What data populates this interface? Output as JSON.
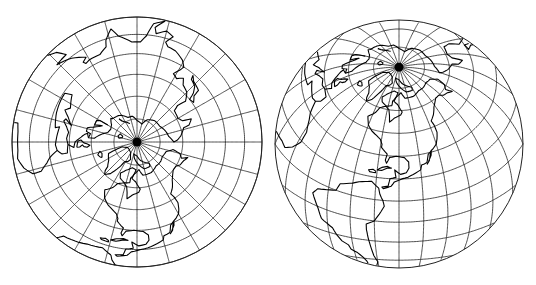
{
  "maps": [
    {
      "name": "polar-azimuthal-map",
      "projection": "lambert-azimuthal-equal-area",
      "center_lat": 90,
      "center_lon": -90,
      "cx": 137,
      "cy": 142,
      "radius": 125,
      "graticule_step_deg": 15,
      "clip_angle_deg": 90
    },
    {
      "name": "oblique-azimuthal-globe",
      "projection": "lambert-azimuthal-equal-area",
      "center_lat": 38,
      "center_lon": -90,
      "cx": 399,
      "cy": 144,
      "radius": 124,
      "graticule_step_deg": 15,
      "clip_angle_deg": 90
    }
  ],
  "colors": {
    "line": "#222222",
    "coast": "#000000",
    "background": "#ffffff"
  },
  "coastlines": [
    {
      "name": "north-america",
      "coords": [
        [
          -168,
          66
        ],
        [
          -162,
          70
        ],
        [
          -150,
          71
        ],
        [
          -140,
          70
        ],
        [
          -128,
          70
        ],
        [
          -115,
          68
        ],
        [
          -100,
          68
        ],
        [
          -94,
          72
        ],
        [
          -85,
          69
        ],
        [
          -82,
          66
        ],
        [
          -88,
          64
        ],
        [
          -94,
          59
        ],
        [
          -92,
          57
        ],
        [
          -85,
          55
        ],
        [
          -80,
          52
        ],
        [
          -79,
          56
        ],
        [
          -77,
          60
        ],
        [
          -72,
          62
        ],
        [
          -65,
          60
        ],
        [
          -62,
          56
        ],
        [
          -56,
          52
        ],
        [
          -60,
          47
        ],
        [
          -65,
          44
        ],
        [
          -70,
          42
        ],
        [
          -74,
          40
        ],
        [
          -76,
          37
        ],
        [
          -76,
          35
        ],
        [
          -81,
          31
        ],
        [
          -80,
          27
        ],
        [
          -81,
          25
        ],
        [
          -83,
          29
        ],
        [
          -88,
          30
        ],
        [
          -94,
          29
        ],
        [
          -97,
          26
        ],
        [
          -97,
          22
        ],
        [
          -95,
          19
        ],
        [
          -91,
          18
        ],
        [
          -87,
          21
        ],
        [
          -88,
          16
        ],
        [
          -84,
          15
        ],
        [
          -83,
          10
        ],
        [
          -79,
          9
        ],
        [
          -80,
          8
        ],
        [
          -85,
          10
        ],
        [
          -87,
          13
        ],
        [
          -92,
          15
        ],
        [
          -96,
          16
        ],
        [
          -105,
          20
        ],
        [
          -106,
          23
        ],
        [
          -110,
          24
        ],
        [
          -112,
          29
        ],
        [
          -115,
          31
        ],
        [
          -117,
          32
        ],
        [
          -120,
          34
        ],
        [
          -122,
          37
        ],
        [
          -124,
          41
        ],
        [
          -124,
          46
        ],
        [
          -123,
          49
        ],
        [
          -128,
          52
        ],
        [
          -133,
          56
        ],
        [
          -137,
          58
        ],
        [
          -142,
          60
        ],
        [
          -148,
          60
        ],
        [
          -152,
          58
        ],
        [
          -158,
          57
        ],
        [
          -163,
          55
        ],
        [
          -160,
          59
        ],
        [
          -165,
          61
        ],
        [
          -168,
          66
        ]
      ]
    },
    {
      "name": "baja",
      "coords": [
        [
          -115,
          31
        ],
        [
          -114,
          28
        ],
        [
          -110,
          23
        ],
        [
          -112,
          25
        ],
        [
          -114,
          30
        ]
      ]
    },
    {
      "name": "south-america",
      "coords": [
        [
          -77,
          8
        ],
        [
          -72,
          12
        ],
        [
          -64,
          10
        ],
        [
          -60,
          8
        ],
        [
          -52,
          5
        ],
        [
          -50,
          0
        ],
        [
          -44,
          -2
        ],
        [
          -38,
          -4
        ],
        [
          -35,
          -8
        ],
        [
          -37,
          -12
        ],
        [
          -39,
          -16
        ],
        [
          -41,
          -22
        ],
        [
          -48,
          -26
        ],
        [
          -50,
          -30
        ],
        [
          -53,
          -34
        ],
        [
          -57,
          -36
        ],
        [
          -58,
          -39
        ],
        [
          -62,
          -41
        ],
        [
          -65,
          -44
        ],
        [
          -67,
          -47
        ],
        [
          -68,
          -51
        ],
        [
          -70,
          -54
        ],
        [
          -73,
          -52
        ],
        [
          -75,
          -47
        ],
        [
          -73,
          -42
        ],
        [
          -72,
          -36
        ],
        [
          -71,
          -30
        ],
        [
          -70,
          -22
        ],
        [
          -70,
          -18
        ],
        [
          -75,
          -15
        ],
        [
          -79,
          -8
        ],
        [
          -81,
          -4
        ],
        [
          -80,
          0
        ],
        [
          -78,
          4
        ],
        [
          -77,
          8
        ]
      ]
    },
    {
      "name": "greenland",
      "coords": [
        [
          -45,
          60
        ],
        [
          -42,
          62
        ],
        [
          -40,
          65
        ],
        [
          -33,
          68
        ],
        [
          -22,
          70
        ],
        [
          -20,
          75
        ],
        [
          -18,
          80
        ],
        [
          -30,
          83
        ],
        [
          -45,
          83
        ],
        [
          -60,
          82
        ],
        [
          -70,
          78
        ],
        [
          -65,
          76
        ],
        [
          -58,
          75
        ],
        [
          -55,
          70
        ],
        [
          -52,
          66
        ],
        [
          -50,
          63
        ],
        [
          -45,
          60
        ]
      ]
    },
    {
      "name": "cuba",
      "coords": [
        [
          -85,
          22
        ],
        [
          -82,
          23
        ],
        [
          -78,
          22
        ],
        [
          -75,
          20
        ],
        [
          -78,
          20
        ],
        [
          -82,
          22
        ],
        [
          -85,
          22
        ]
      ]
    },
    {
      "name": "hispaniola",
      "coords": [
        [
          -74,
          19
        ],
        [
          -72,
          20
        ],
        [
          -69,
          19
        ],
        [
          -70,
          18
        ],
        [
          -74,
          18
        ],
        [
          -74,
          19
        ]
      ]
    },
    {
      "name": "baffin",
      "coords": [
        [
          -80,
          63
        ],
        [
          -73,
          62
        ],
        [
          -65,
          64
        ],
        [
          -62,
          67
        ],
        [
          -68,
          70
        ],
        [
          -75,
          72
        ],
        [
          -80,
          73
        ],
        [
          -88,
          72
        ],
        [
          -85,
          69
        ],
        [
          -80,
          66
        ],
        [
          -80,
          63
        ]
      ]
    },
    {
      "name": "arctic-islands",
      "coords": [
        [
          -120,
          74
        ],
        [
          -110,
          76
        ],
        [
          -100,
          78
        ],
        [
          -90,
          81
        ],
        [
          -75,
          82
        ],
        [
          -82,
          79
        ],
        [
          -95,
          75
        ],
        [
          -105,
          72
        ],
        [
          -118,
          72
        ],
        [
          -120,
          74
        ]
      ]
    },
    {
      "name": "eurasia-africa",
      "coords": [
        [
          -6,
          36
        ],
        [
          -9,
          39
        ],
        [
          -9,
          43
        ],
        [
          -2,
          44
        ],
        [
          -5,
          48
        ],
        [
          0,
          49
        ],
        [
          5,
          53
        ],
        [
          8,
          55
        ],
        [
          10,
          57
        ],
        [
          5,
          58
        ],
        [
          5,
          62
        ],
        [
          12,
          66
        ],
        [
          18,
          70
        ],
        [
          26,
          71
        ],
        [
          34,
          70
        ],
        [
          42,
          67
        ],
        [
          44,
          68
        ],
        [
          55,
          69
        ],
        [
          60,
          70
        ],
        [
          70,
          73
        ],
        [
          80,
          73
        ],
        [
          90,
          76
        ],
        [
          105,
          78
        ],
        [
          115,
          74
        ],
        [
          130,
          72
        ],
        [
          145,
          72
        ],
        [
          160,
          70
        ],
        [
          170,
          69
        ],
        [
          180,
          66
        ],
        [
          178,
          64
        ],
        [
          172,
          61
        ],
        [
          163,
          58
        ],
        [
          162,
          54
        ],
        [
          157,
          51
        ],
        [
          155,
          57
        ],
        [
          150,
          59
        ],
        [
          140,
          58
        ],
        [
          138,
          54
        ],
        [
          140,
          48
        ],
        [
          135,
          43
        ],
        [
          129,
          41
        ],
        [
          126,
          37
        ],
        [
          122,
          40
        ],
        [
          118,
          38
        ],
        [
          121,
          33
        ],
        [
          122,
          30
        ],
        [
          119,
          26
        ],
        [
          113,
          22
        ],
        [
          108,
          21
        ],
        [
          106,
          18
        ],
        [
          109,
          12
        ],
        [
          105,
          9
        ],
        [
          100,
          13
        ],
        [
          99,
          8
        ],
        [
          103,
          1
        ],
        [
          98,
          5
        ],
        [
          95,
          16
        ],
        [
          92,
          21
        ],
        [
          87,
          21
        ],
        [
          80,
          15
        ],
        [
          77,
          8
        ],
        [
          73,
          16
        ],
        [
          72,
          21
        ],
        [
          67,
          25
        ],
        [
          60,
          25
        ],
        [
          57,
          26
        ],
        [
          56,
          24
        ],
        [
          59,
          22
        ],
        [
          52,
          16
        ],
        [
          44,
          12
        ],
        [
          51,
          11
        ],
        [
          48,
          4
        ],
        [
          40,
          -3
        ],
        [
          39,
          -10
        ],
        [
          40,
          -15
        ],
        [
          35,
          -22
        ],
        [
          32,
          -28
        ],
        [
          27,
          -34
        ],
        [
          20,
          -35
        ],
        [
          18,
          -32
        ],
        [
          15,
          -26
        ],
        [
          12,
          -18
        ],
        [
          13,
          -10
        ],
        [
          9,
          -1
        ],
        [
          9,
          4
        ],
        [
          5,
          5
        ],
        [
          -4,
          5
        ],
        [
          -8,
          4
        ],
        [
          -13,
          8
        ],
        [
          -17,
          14
        ],
        [
          -17,
          21
        ],
        [
          -13,
          27
        ],
        [
          -10,
          30
        ],
        [
          -6,
          36
        ]
      ]
    },
    {
      "name": "mediterranean-north",
      "coords": [
        [
          -2,
          44
        ],
        [
          3,
          43
        ],
        [
          8,
          44
        ],
        [
          12,
          42
        ],
        [
          16,
          39
        ],
        [
          18,
          40
        ],
        [
          14,
          45
        ],
        [
          20,
          41
        ],
        [
          24,
          37
        ],
        [
          27,
          40
        ],
        [
          36,
          36
        ],
        [
          34,
          31
        ],
        [
          30,
          31
        ],
        [
          20,
          32
        ],
        [
          10,
          34
        ],
        [
          11,
          37
        ],
        [
          -2,
          35
        ],
        [
          -6,
          36
        ]
      ]
    },
    {
      "name": "britain",
      "coords": [
        [
          -5,
          50
        ],
        [
          1,
          51
        ],
        [
          2,
          53
        ],
        [
          -1,
          55
        ],
        [
          -2,
          57
        ],
        [
          -4,
          59
        ],
        [
          -6,
          57
        ],
        [
          -5,
          55
        ],
        [
          -3,
          54
        ],
        [
          -5,
          52
        ],
        [
          -5,
          50
        ]
      ]
    },
    {
      "name": "scandinavia",
      "coords": [
        [
          5,
          58
        ],
        [
          10,
          59
        ],
        [
          12,
          56
        ],
        [
          16,
          56
        ],
        [
          19,
          60
        ],
        [
          22,
          63
        ],
        [
          25,
          65
        ],
        [
          22,
          60
        ],
        [
          28,
          60
        ],
        [
          30,
          62
        ],
        [
          30,
          68
        ]
      ]
    },
    {
      "name": "iceland",
      "coords": [
        [
          -24,
          65
        ],
        [
          -18,
          66
        ],
        [
          -14,
          65
        ],
        [
          -18,
          63
        ],
        [
          -22,
          64
        ],
        [
          -24,
          65
        ]
      ]
    },
    {
      "name": "japan",
      "coords": [
        [
          130,
          31
        ],
        [
          133,
          34
        ],
        [
          140,
          36
        ],
        [
          141,
          41
        ],
        [
          145,
          44
        ],
        [
          141,
          45
        ],
        [
          139,
          40
        ],
        [
          136,
          36
        ],
        [
          131,
          34
        ],
        [
          130,
          31
        ]
      ]
    },
    {
      "name": "novaya-zemlya",
      "coords": [
        [
          52,
          71
        ],
        [
          56,
          74
        ],
        [
          64,
          76
        ],
        [
          68,
          77
        ],
        [
          60,
          75
        ],
        [
          54,
          73
        ],
        [
          52,
          71
        ]
      ]
    },
    {
      "name": "svalbard",
      "coords": [
        [
          12,
          78
        ],
        [
          16,
          80
        ],
        [
          22,
          80
        ],
        [
          26,
          78
        ],
        [
          18,
          77
        ],
        [
          12,
          78
        ]
      ]
    }
  ]
}
